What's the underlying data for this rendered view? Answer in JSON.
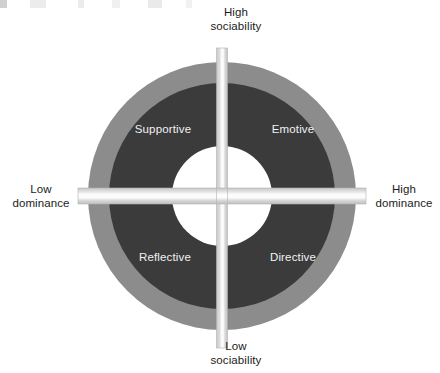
{
  "diagram": {
    "type": "social-styles-quadrant-wheel",
    "geometry": {
      "center_x": 222,
      "center_y": 196,
      "outer_radius": 134,
      "inner_disc_radius": 113,
      "hole_radius": 50,
      "vertical_band_width": 11,
      "horizontal_band_height": 16,
      "axis_overhang": 12
    },
    "colors": {
      "outer_ring": "#8c8c8c",
      "inner_disc": "#3b3b3b",
      "band": "#cfcfcf",
      "band_core": "#f7f7f7",
      "hole": "#ffffff",
      "page_background": "#ffffff",
      "quad_label_text": "#f2f2f2",
      "axis_label_text": "#1b1b1b"
    },
    "axes": [
      {
        "id": "high-sociability",
        "position": "top",
        "line1": "High",
        "line2": "sociability"
      },
      {
        "id": "low-sociability",
        "position": "bottom",
        "line1": "Low",
        "line2": "sociability"
      },
      {
        "id": "low-dominance",
        "position": "left",
        "line1": "Low",
        "line2": "dominance"
      },
      {
        "id": "high-dominance",
        "position": "right",
        "line1": "High",
        "line2": "dominance"
      }
    ],
    "quadrants": [
      {
        "id": "supportive",
        "label": "Supportive",
        "position": "top-left"
      },
      {
        "id": "emotive",
        "label": "Emotive",
        "position": "top-right"
      },
      {
        "id": "reflective",
        "label": "Reflective",
        "position": "bottom-left"
      },
      {
        "id": "directive",
        "label": "Directive",
        "position": "bottom-right"
      }
    ]
  }
}
